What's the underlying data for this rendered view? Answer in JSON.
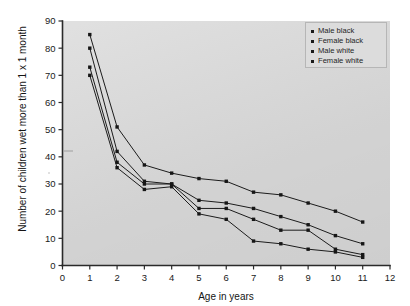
{
  "chart_data": {
    "type": "line",
    "title": "",
    "xlabel": "Age in years",
    "ylabel": "Number of children wet more than 1 x 1 month",
    "xlim": [
      0,
      12
    ],
    "ylim": [
      0,
      90
    ],
    "xticks": [
      0,
      1,
      2,
      3,
      4,
      5,
      6,
      7,
      8,
      9,
      10,
      11,
      12
    ],
    "yticks": [
      0,
      10,
      20,
      30,
      40,
      50,
      60,
      70,
      80,
      90
    ],
    "grid": false,
    "legend_position": "top-right",
    "x": [
      1,
      2,
      3,
      4,
      5,
      6,
      7,
      8,
      9,
      10,
      11
    ],
    "series": [
      {
        "name": "Male black",
        "marker": "square",
        "values": [
          85,
          51,
          37,
          34,
          32,
          31,
          27,
          26,
          23,
          20,
          16
        ]
      },
      {
        "name": "Female black",
        "marker": "triangle",
        "values": [
          80,
          42,
          31,
          30,
          24,
          23,
          21,
          18,
          15,
          11,
          8
        ]
      },
      {
        "name": "Male white",
        "marker": "square",
        "values": [
          73,
          38,
          30,
          30,
          21,
          21,
          17,
          13,
          13,
          6,
          4
        ]
      },
      {
        "name": "Female white",
        "marker": "circle",
        "values": [
          70,
          36,
          28,
          29,
          19,
          17,
          9,
          8,
          6,
          5,
          3
        ]
      }
    ]
  },
  "legend": {
    "entries": [
      {
        "label": "Male black"
      },
      {
        "label": "Female black"
      },
      {
        "label": "Male white"
      },
      {
        "label": "Female white"
      }
    ]
  },
  "axes": {
    "x_title": "Age in years",
    "y_title": "Number of children wet more than 1 x 1 month",
    "x_tick_labels": [
      "0",
      "1",
      "2",
      "3",
      "4",
      "5",
      "6",
      "7",
      "8",
      "9",
      "10",
      "11",
      "12"
    ],
    "y_tick_labels": [
      "0",
      "10",
      "20",
      "30",
      "40",
      "50",
      "60",
      "70",
      "80",
      "90"
    ]
  },
  "style": {
    "panel_color": "#d9d9d9",
    "line_color": "#1c1c1c",
    "marker_color": "#161616",
    "axis_color": "#2a2a2a",
    "page_color": "#ffffff"
  }
}
